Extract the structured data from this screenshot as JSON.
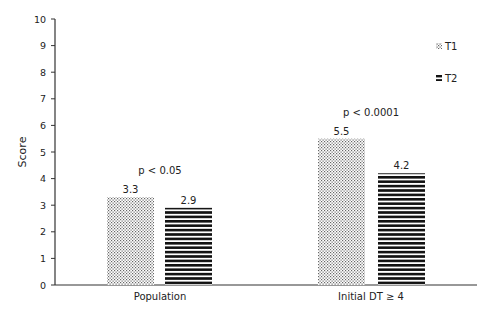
{
  "chart_data": {
    "type": "bar",
    "title": "",
    "xlabel": "",
    "ylabel": "Score",
    "ylim": [
      0,
      10
    ],
    "yticks": [
      0,
      1,
      2,
      3,
      4,
      5,
      6,
      7,
      8,
      9,
      10
    ],
    "grid": false,
    "legend_position": "top-right",
    "categories": [
      "Population",
      "Initial DT ≥ 4"
    ],
    "series": [
      {
        "name": "T1",
        "pattern": "dotted",
        "values": [
          3.3,
          5.5
        ]
      },
      {
        "name": "T2",
        "pattern": "horizontal-stripes",
        "values": [
          2.9,
          4.2
        ]
      }
    ],
    "value_labels": [
      [
        "3.3",
        "5.5"
      ],
      [
        "2.9",
        "4.2"
      ]
    ],
    "annotations": [
      {
        "category": "Population",
        "text": "p < 0.05"
      },
      {
        "category": "Initial DT ≥ 4",
        "text": "p < 0.0001"
      }
    ]
  },
  "colors": {
    "axis": "#333333",
    "t2_stripe": "#111111",
    "t1_dot": "#555555"
  }
}
